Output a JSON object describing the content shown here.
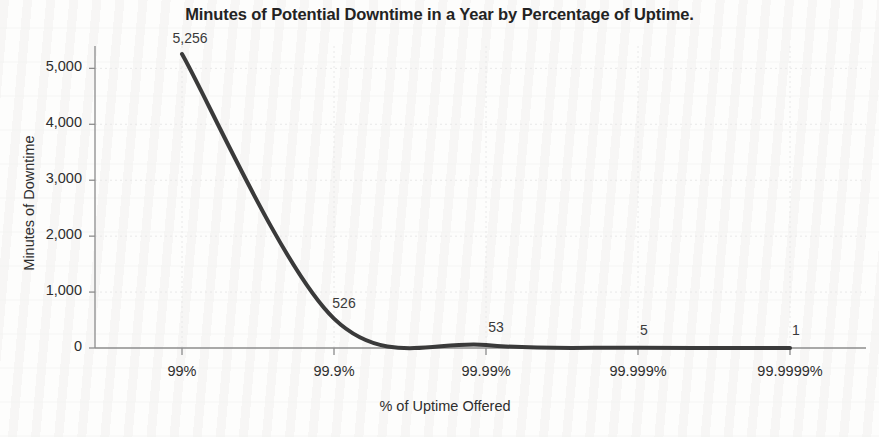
{
  "chart_data": {
    "type": "line",
    "title": "Minutes of Potential Downtime in a Year by Percentage of Uptime.",
    "xlabel": "% of Uptime Offered",
    "ylabel": "Minutes of Downtime",
    "categories": [
      "99%",
      "99.9%",
      "99.99%",
      "99.999%",
      "99.9999%"
    ],
    "values": [
      5256,
      526,
      53,
      5,
      1
    ],
    "point_labels": [
      "5,256",
      "526",
      "53",
      "5",
      "1"
    ],
    "ylim": [
      0,
      5400
    ],
    "yticks": [
      0,
      1000,
      2000,
      3000,
      4000,
      5000
    ],
    "ytick_labels": [
      "0",
      "1,000",
      "2,000",
      "3,000",
      "4,000",
      "5,000"
    ],
    "grid": true,
    "grid_style": "dotted",
    "legend": "none",
    "line_color": "#3a3a3a",
    "line_width": 4,
    "smoothing": "spline",
    "axis_color": "#8c8c8c",
    "grid_color": "#e8e8e8",
    "background_color": "#fdfdfc",
    "text_color": "#2e2e2e"
  }
}
